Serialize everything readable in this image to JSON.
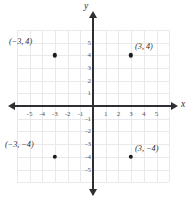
{
  "chart_data": {
    "type": "scatter",
    "title": "",
    "xlabel": "x",
    "ylabel": "y",
    "xlim": [
      -6,
      6
    ],
    "ylim": [
      -6,
      6
    ],
    "grid": true,
    "legend": false,
    "x_ticks": [
      "-5",
      "-4",
      "-3",
      "-2",
      "-1",
      "1",
      "2",
      "3",
      "4",
      "5"
    ],
    "x_tick_values": [
      -5,
      -4,
      -3,
      -2,
      -1,
      1,
      2,
      3,
      4,
      5
    ],
    "y_ticks": [
      "5",
      "4",
      "3",
      "2",
      "1",
      "-1",
      "-2",
      "-3",
      "-4",
      "-5"
    ],
    "y_tick_values": [
      5,
      4,
      3,
      2,
      1,
      -1,
      -2,
      -3,
      -4,
      -5
    ],
    "points": [
      {
        "x": -3,
        "y": 4,
        "label": "(−3, 4)"
      },
      {
        "x": 3,
        "y": 4,
        "label": "(3, 4)"
      },
      {
        "x": -3,
        "y": -4,
        "label": "(−3, −4)"
      },
      {
        "x": 3,
        "y": -4,
        "label": "(3, −4)"
      }
    ],
    "colors": {
      "point": "#1b1b1f",
      "axis": "#2e2e33",
      "grid": "#e9e9ec",
      "tick_text": "#56565c",
      "background": "#ffffff"
    }
  },
  "axis_labels": {
    "x": "x",
    "y": "y"
  }
}
